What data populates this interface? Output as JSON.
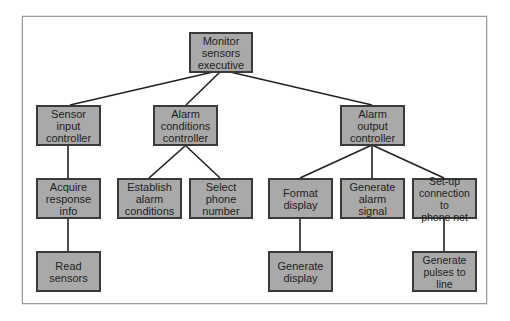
{
  "diagram": {
    "type": "structure-chart",
    "colors": {
      "box_fill": "#a9a9a9",
      "box_border": "#3a3a3a",
      "line": "#222222",
      "frame": "#9a9a9a"
    },
    "nodes": {
      "monitor": {
        "label": "Monitor\nsensors\nexecutive"
      },
      "sensor_input": {
        "label": "Sensor input\ncontroller"
      },
      "alarm_conditions": {
        "label": "Alarm\nconditions\ncontroller"
      },
      "alarm_output": {
        "label": "Alarm\noutput\ncontroller"
      },
      "acquire": {
        "label": "Acquire\nresponse\ninfo"
      },
      "establish": {
        "label": "Establish\nalarm\nconditions"
      },
      "select_phone": {
        "label": "Select\nphone\nnumber"
      },
      "format_display": {
        "label": "Format\ndisplay"
      },
      "generate_alarm": {
        "label": "Generate\nalarm\nsignal"
      },
      "setup_connection": {
        "label": "Set-up\nconnection to\nphone net"
      },
      "read_sensors": {
        "label": "Read\nsensors"
      },
      "generate_display": {
        "label": "Generate\ndisplay"
      },
      "generate_pulses": {
        "label": "Generate\npulses to line"
      }
    },
    "edges": [
      [
        "monitor",
        "sensor_input"
      ],
      [
        "monitor",
        "alarm_conditions"
      ],
      [
        "monitor",
        "alarm_output"
      ],
      [
        "sensor_input",
        "acquire"
      ],
      [
        "acquire",
        "read_sensors"
      ],
      [
        "alarm_conditions",
        "establish"
      ],
      [
        "alarm_conditions",
        "select_phone"
      ],
      [
        "alarm_output",
        "format_display"
      ],
      [
        "alarm_output",
        "generate_alarm"
      ],
      [
        "alarm_output",
        "setup_connection"
      ],
      [
        "format_display",
        "generate_display"
      ],
      [
        "setup_connection",
        "generate_pulses"
      ]
    ]
  }
}
